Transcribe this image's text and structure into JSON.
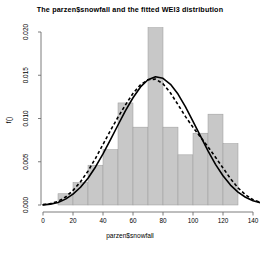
{
  "chart_data": {
    "type": "bar",
    "title": "The parzen$snowfall and the fitted WEI3 distribution",
    "xlabel": "parzen$snowfall",
    "ylabel": "f()",
    "xlim": [
      0,
      145
    ],
    "ylim": [
      0,
      0.02
    ],
    "grid": false,
    "legend": "none",
    "xticks": [
      "0",
      "20",
      "40",
      "60",
      "80",
      "100",
      "120",
      "140"
    ],
    "xtick_values": [
      0,
      20,
      40,
      60,
      80,
      100,
      120,
      140
    ],
    "yticks": [
      "0.000",
      "0.005",
      "0.010",
      "0.015",
      "0.020"
    ],
    "ytick_values": [
      0.0,
      0.005,
      0.01,
      0.015,
      0.02
    ],
    "histogram": {
      "name": "parzen$snowfall histogram",
      "bin_width": 10,
      "bin_starts": [
        10,
        20,
        30,
        40,
        50,
        60,
        70,
        80,
        90,
        100,
        110,
        120
      ],
      "densities": [
        0.0013,
        0.0026,
        0.0046,
        0.0064,
        0.0118,
        0.009,
        0.0205,
        0.009,
        0.0058,
        0.0083,
        0.0105,
        0.0071
      ],
      "fill_color": "#c8c8c8",
      "edge_color": "#9a9a9a"
    },
    "series": [
      {
        "name": "fitted WEI3 distribution",
        "style": "solid",
        "color": "#000000",
        "x": [
          0,
          5,
          10,
          15,
          20,
          25,
          30,
          35,
          40,
          45,
          50,
          55,
          60,
          65,
          70,
          75,
          80,
          85,
          90,
          95,
          100,
          105,
          110,
          115,
          120,
          125,
          130,
          135,
          140,
          145
        ],
        "y": [
          2e-05,
          0.0001,
          0.0003,
          0.00068,
          0.00125,
          0.00205,
          0.0031,
          0.0044,
          0.0059,
          0.00755,
          0.00925,
          0.0109,
          0.0124,
          0.01365,
          0.01448,
          0.01482,
          0.01465,
          0.01395,
          0.01282,
          0.01135,
          0.00968,
          0.00795,
          0.00625,
          0.0047,
          0.00338,
          0.0023,
          0.00148,
          0.0009,
          0.0005,
          0.00026
        ]
      },
      {
        "name": "parzen kernel density",
        "style": "dashed",
        "color": "#000000",
        "x": [
          0,
          5,
          10,
          15,
          20,
          25,
          30,
          35,
          40,
          45,
          50,
          55,
          60,
          65,
          70,
          75,
          80,
          85,
          90,
          95,
          100,
          105,
          110,
          115,
          120,
          125,
          130,
          135,
          140,
          145
        ],
        "y": [
          4e-05,
          0.00016,
          0.00042,
          0.00092,
          0.00168,
          0.00268,
          0.00392,
          0.0054,
          0.007,
          0.00862,
          0.01015,
          0.01158,
          0.0129,
          0.0139,
          0.01448,
          0.01455,
          0.01402,
          0.01295,
          0.0116,
          0.01022,
          0.00898,
          0.00785,
          0.00672,
          0.00552,
          0.00428,
          0.00305,
          0.00198,
          0.00118,
          0.00062,
          0.0003
        ]
      }
    ]
  },
  "axes": {
    "tick_color": "#6e6e6e",
    "axis_line_color": "#6e6e6e"
  }
}
